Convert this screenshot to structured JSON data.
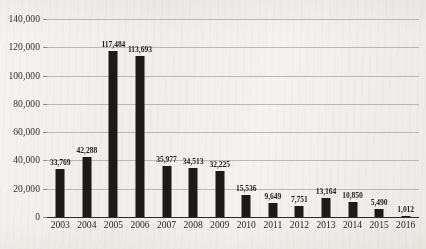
{
  "chart_data": {
    "type": "bar",
    "title": "",
    "subtitle": "",
    "xlabel": "",
    "ylabel": "",
    "categories": [
      "2003",
      "2004",
      "2005",
      "2006",
      "2007",
      "2008",
      "2009",
      "2010",
      "2011",
      "2012",
      "2013",
      "2014",
      "2015",
      "2016"
    ],
    "values": [
      33769,
      42288,
      117484,
      113693,
      35977,
      34513,
      32225,
      15536,
      9649,
      7751,
      13164,
      10850,
      5490,
      1012
    ],
    "value_labels": [
      "33,769",
      "42,288",
      "117,484",
      "113,693",
      "35,977",
      "34,513",
      "32,225",
      "15,536",
      "9,649",
      "7,751",
      "13,164",
      "10,850",
      "5,490",
      "1,012"
    ],
    "ylim": [
      0,
      140000
    ],
    "ytick_values": [
      0,
      20000,
      40000,
      60000,
      80000,
      100000,
      120000,
      140000
    ],
    "ytick_labels": [
      "0",
      "20,000",
      "40,000",
      "60,000",
      "80,000",
      "100,000",
      "120,000",
      "140,000"
    ],
    "grid": true,
    "legend": false,
    "legend_position": "none",
    "bar_color": "#1c1b1a",
    "gridline_color": "#b9b7b2",
    "axis_color": "#2b2b2b",
    "background_color": "#f2f1ee",
    "data_labels_shown": true
  }
}
